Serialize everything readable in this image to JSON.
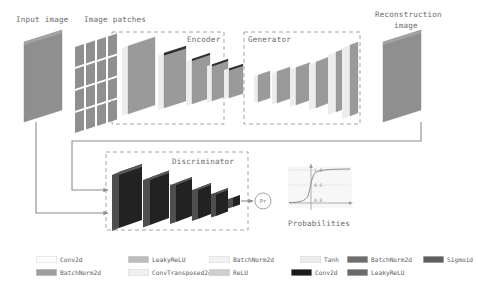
{
  "diagram": {
    "title_implicit": "GAN anomaly detection architecture",
    "stage_labels": {
      "input_image": "Input image",
      "image_patches": "Image patches",
      "encoder": "Encoder",
      "generator": "Generator",
      "reconstruction_image_line1": "Reconstruction",
      "reconstruction_image_line2": "image",
      "discriminator": "Discriminator",
      "probabilities": "Probabilities",
      "pr_node": "Pr"
    },
    "sigmoid_plot": {
      "ticks": [
        "1.0",
        "0.5",
        "0.0"
      ],
      "curve": "sigmoid"
    },
    "blocks": {
      "input_image": {
        "count": 1,
        "color": "#8f8f8f"
      },
      "image_patches": {
        "rows": 4,
        "cols": 4,
        "color": "#8f8f8f"
      },
      "encoder_layers": {
        "count": 5,
        "color": "#9a9a9a",
        "trend": "decreasing"
      },
      "generator_layers": {
        "count": 6,
        "color": "#9a9a9a",
        "trend": "increasing"
      },
      "reconstruction_image": {
        "count": 1,
        "color": "#8f8f8f"
      },
      "discriminator_layers": {
        "count": 5,
        "color": "#2b2b2b",
        "trend": "decreasing"
      }
    }
  },
  "legend": {
    "row1": [
      {
        "label": "Conv2d",
        "color": "#fdfdfd",
        "x": 36,
        "label_x": 62
      },
      {
        "label": "LeakyReLU",
        "color": "#bcbcbc",
        "x": 128,
        "label_x": 154
      },
      {
        "label": "BatchNorm2d",
        "color": "#f2f2f2",
        "x": 209,
        "label_x": 235
      },
      {
        "label": "Tanh",
        "color": "#ececec",
        "x": 300,
        "label_x": 326
      },
      {
        "label": "BatchNorm2d",
        "color": "#6e6e6e",
        "x": 347,
        "label_x": 373
      },
      {
        "label": "Sigmoid",
        "color": "#5f5f5f",
        "x": 423,
        "label_x": 449
      }
    ],
    "row2": [
      {
        "label": "BatchNorm2d",
        "color": "#9d9d9d",
        "x": 36,
        "label_x": 62
      },
      {
        "label": "ConvTransposed2d",
        "color": "#f0f0f0",
        "x": 128,
        "label_x": 154
      },
      {
        "label": "ReLU",
        "color": "#cfcfcf",
        "x": 209,
        "label_x": 235
      },
      {
        "label": "Conv2d",
        "color": "#1b1b1b",
        "x": 291,
        "label_x": 317
      },
      {
        "label": "LeakyReLU",
        "color": "#6a6a6a",
        "x": 347,
        "label_x": 373
      }
    ]
  }
}
